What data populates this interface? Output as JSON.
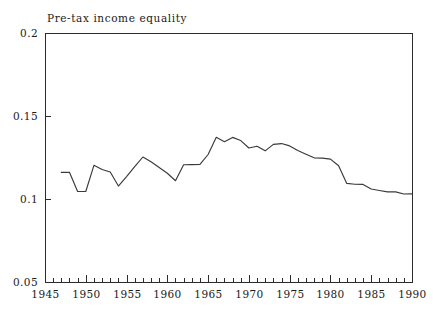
{
  "chart_data": {
    "type": "line",
    "title": "Pre-tax income equality",
    "xlabel": "",
    "ylabel": "",
    "xlim": [
      1945,
      1990
    ],
    "ylim": [
      0.05,
      0.2
    ],
    "grid": false,
    "legend": null,
    "y_ticks": [
      0.05,
      0.1,
      0.15,
      0.2
    ],
    "y_tick_labels": [
      "0.05",
      "0.1",
      "0.15",
      "0.2"
    ],
    "x_ticks": [
      1945,
      1950,
      1955,
      1960,
      1965,
      1970,
      1975,
      1980,
      1985,
      1990
    ],
    "x_tick_labels": [
      "1945",
      "1950",
      "1955",
      "1960",
      "1965",
      "1970",
      "1975",
      "1980",
      "1985",
      "1990"
    ],
    "x_minor_tick_step": 1,
    "line_color": "#3a3a3a",
    "series": [
      {
        "name": "Pre-tax income equality",
        "x": [
          1947,
          1948,
          1949,
          1950,
          1951,
          1952,
          1953,
          1954,
          1955,
          1956,
          1957,
          1958,
          1959,
          1960,
          1961,
          1962,
          1963,
          1964,
          1965,
          1966,
          1967,
          1968,
          1969,
          1970,
          1971,
          1972,
          1973,
          1974,
          1975,
          1976,
          1977,
          1978,
          1979,
          1980,
          1981,
          1982,
          1983,
          1984,
          1985,
          1986,
          1987,
          1988,
          1989,
          1990
        ],
        "values": [
          0.116,
          0.1161,
          0.1045,
          0.1045,
          0.1203,
          0.1178,
          0.1163,
          0.1078,
          0.1135,
          0.1195,
          0.1253,
          0.1224,
          0.119,
          0.1155,
          0.111,
          0.1206,
          0.1207,
          0.1208,
          0.1268,
          0.1372,
          0.1345,
          0.1371,
          0.1352,
          0.1307,
          0.1318,
          0.129,
          0.1329,
          0.1334,
          0.132,
          0.1292,
          0.127,
          0.1248,
          0.1246,
          0.124,
          0.12,
          0.1094,
          0.1089,
          0.1088,
          0.106,
          0.1051,
          0.1043,
          0.1043,
          0.103,
          0.1031
        ]
      }
    ]
  },
  "layout": {
    "plot_left": 45,
    "plot_right": 412,
    "plot_top": 33,
    "plot_bottom": 282
  }
}
